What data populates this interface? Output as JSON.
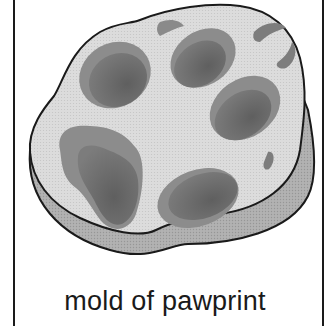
{
  "figure": {
    "caption": "mold of pawprint",
    "colors": {
      "outline": "#1a1a1a",
      "mold_top": "#d8d8d8",
      "mold_side": "#a8a8a8",
      "impression_light": "#8e8e8e",
      "impression_dark": "#6e6e6e",
      "background": "#ffffff"
    },
    "parts": {
      "toe_pads": 4,
      "claw_marks": 2,
      "main_pad": 1
    }
  }
}
